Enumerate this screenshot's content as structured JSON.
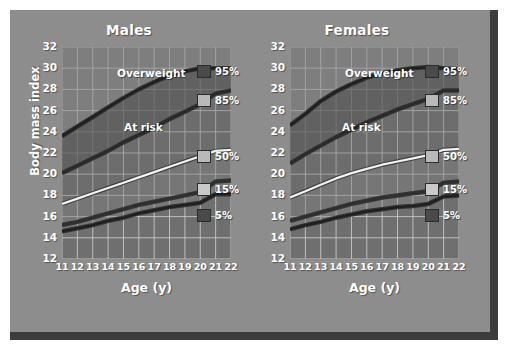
{
  "figure": {
    "background_color": "#8d8d8d",
    "frame_shadow_color": "#3c3c3c"
  },
  "axes": {
    "ylabel": "Body mass index",
    "xlabel": "Age (y)",
    "yticks": [
      "12",
      "14",
      "16",
      "18",
      "20",
      "22",
      "24",
      "26",
      "28",
      "30",
      "32"
    ],
    "xticks": [
      "11",
      "12",
      "13",
      "14",
      "15",
      "16",
      "17",
      "18",
      "19",
      "20",
      "21",
      "22"
    ]
  },
  "panels": [
    {
      "key": "males",
      "title": "Males"
    },
    {
      "key": "females",
      "title": "Females"
    }
  ],
  "annotations": {
    "overweight": "Overweight",
    "at_risk": "At risk"
  },
  "legend": {
    "entries": [
      {
        "label": "95%",
        "swatch_color": "#4a4a4a"
      },
      {
        "label": "85%",
        "swatch_color": "#b9b9b9"
      },
      {
        "label": "50%",
        "swatch_color": "#b9b9b9"
      },
      {
        "label": "15%",
        "swatch_color": "#c9c9c9"
      },
      {
        "label": "5%",
        "swatch_color": "#4a4a4a"
      }
    ]
  },
  "chart_data": {
    "type": "line",
    "xlabel": "Age (y)",
    "ylabel": "Body mass index",
    "xlim": [
      11,
      22
    ],
    "ylim": [
      12,
      32
    ],
    "grid": true,
    "x": [
      11,
      12,
      13,
      14,
      15,
      16,
      17,
      18,
      19,
      20,
      21,
      22
    ],
    "panels": [
      {
        "name": "Males",
        "series": [
          {
            "name": "95%",
            "values": [
              23.6,
              24.5,
              25.4,
              26.3,
              27.2,
              28.0,
              28.7,
              29.3,
              29.7,
              30.0,
              30.0,
              30.0
            ]
          },
          {
            "name": "85%",
            "values": [
              20.1,
              20.8,
              21.5,
              22.2,
              23.0,
              23.7,
              24.4,
              25.2,
              25.9,
              26.6,
              27.6,
              27.9
            ]
          },
          {
            "name": "50%",
            "values": [
              17.2,
              17.7,
              18.2,
              18.7,
              19.2,
              19.7,
              20.2,
              20.7,
              21.2,
              21.7,
              22.2,
              22.3
            ]
          },
          {
            "name": "15%",
            "values": [
              15.2,
              15.5,
              15.9,
              16.3,
              16.7,
              17.1,
              17.4,
              17.7,
              18.0,
              18.3,
              19.3,
              19.4
            ]
          },
          {
            "name": "5%",
            "values": [
              14.6,
              14.9,
              15.2,
              15.6,
              15.9,
              16.3,
              16.6,
              16.9,
              17.1,
              17.3,
              18.1,
              18.1
            ]
          }
        ]
      },
      {
        "name": "Females",
        "series": [
          {
            "name": "95%",
            "values": [
              24.6,
              25.7,
              26.9,
              27.8,
              28.5,
              29.1,
              29.5,
              29.8,
              30.0,
              30.1,
              30.0,
              29.9
            ]
          },
          {
            "name": "85%",
            "values": [
              21.0,
              21.9,
              22.7,
              23.5,
              24.2,
              24.9,
              25.5,
              26.1,
              26.6,
              27.1,
              27.9,
              27.9
            ]
          },
          {
            "name": "50%",
            "values": [
              17.8,
              18.4,
              19.0,
              19.6,
              20.1,
              20.5,
              20.9,
              21.2,
              21.5,
              21.8,
              22.3,
              22.4
            ]
          },
          {
            "name": "15%",
            "values": [
              15.6,
              16.0,
              16.4,
              16.8,
              17.2,
              17.5,
              17.8,
              18.0,
              18.2,
              18.4,
              19.2,
              19.3
            ]
          },
          {
            "name": "5%",
            "values": [
              14.8,
              15.2,
              15.5,
              15.9,
              16.2,
              16.5,
              16.7,
              16.9,
              17.0,
              17.2,
              17.9,
              18.0
            ]
          }
        ]
      }
    ],
    "bands": [
      {
        "name": "Overweight",
        "above_series": "95%"
      },
      {
        "name": "At risk",
        "between": [
          "85%",
          "95%"
        ]
      }
    ]
  }
}
